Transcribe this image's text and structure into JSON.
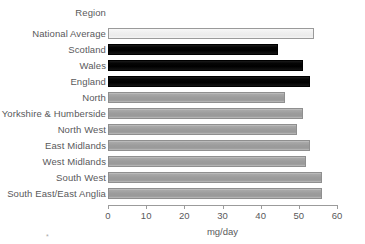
{
  "chart_data": {
    "type": "bar",
    "orientation": "horizontal",
    "title": "",
    "category_axis_title": "Region",
    "xlabel": "mg/day",
    "ylabel": "",
    "xlim": [
      0,
      60
    ],
    "xticks": [
      0,
      10,
      20,
      30,
      40,
      50,
      60
    ],
    "xtick_labels": [
      "0",
      "10",
      "20",
      "30",
      "40",
      "50",
      "60"
    ],
    "grid": false,
    "legend": "none",
    "categories": [
      "National Average",
      "Scotland",
      "Wales",
      "England",
      "North",
      "Yorkshire & Humberside",
      "North West",
      "East Midlands",
      "West Midlands",
      "South West",
      "South East/East Anglia"
    ],
    "values": [
      54,
      44.5,
      51,
      53,
      46.5,
      51,
      49.5,
      53,
      52,
      56,
      56
    ],
    "bar_styles": [
      "white",
      "black",
      "black",
      "black",
      "grey",
      "grey",
      "grey",
      "grey",
      "grey",
      "grey",
      "grey"
    ]
  },
  "colors": {
    "text": "#59595b",
    "axis": "#9b9b9b",
    "bar_grey": "#9c9c9c",
    "bar_black": "#000000",
    "bar_white": "#efefef",
    "background": "#ffffff"
  },
  "footnote_mark": "*"
}
